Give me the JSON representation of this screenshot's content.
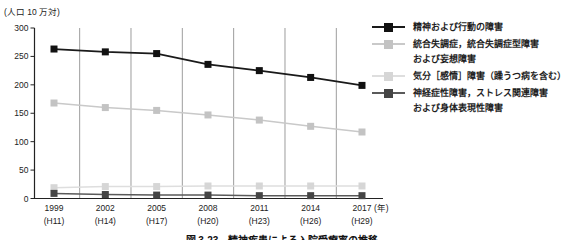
{
  "caption": "図 3-23　精神疾患による入院受療率の推移",
  "chart_data": {
    "type": "line",
    "unit_label": "(人口 10 万対)",
    "x_suffix": "(年)",
    "ylim": [
      0,
      300
    ],
    "yticks": [
      0,
      50,
      100,
      150,
      200,
      250,
      300
    ],
    "grid": "vertical-between-categories",
    "legend_position": "right",
    "categories": [
      {
        "year": "1999",
        "era": "(H11)"
      },
      {
        "year": "2002",
        "era": "(H14)"
      },
      {
        "year": "2005",
        "era": "(H17)"
      },
      {
        "year": "2008",
        "era": "(H20)"
      },
      {
        "year": "2011",
        "era": "(H23)"
      },
      {
        "year": "2014",
        "era": "(H26)"
      },
      {
        "year": "2017",
        "era": "(H29)"
      }
    ],
    "series": [
      {
        "name": "精神および行動の障害",
        "legend_lines": [
          "精神および行動の障害"
        ],
        "line_color": "#1a1a1a",
        "marker_color": "#111111",
        "values": [
          263,
          258,
          255,
          236,
          225,
          213,
          199
        ]
      },
      {
        "name": "統合失調症，統合失調症型障害および妄想障害",
        "legend_lines": [
          "統合失調症，統合失調症型障害",
          "および妄想障害"
        ],
        "line_color": "#c9c9c9",
        "marker_color": "#c3c3c3",
        "values": [
          168,
          160,
          155,
          147,
          138,
          127,
          117
        ]
      },
      {
        "name": "気分［感情］障害（躁うつ病を含む）",
        "legend_lines": [
          "気分［感情］障害（躁うつ病を含む）"
        ],
        "line_color": "#dedede",
        "marker_color": "#d6d6d6",
        "values": [
          19,
          21,
          21,
          22,
          22,
          22,
          22
        ]
      },
      {
        "name": "神経症性障害，ストレス関連障害および身体表現性障害",
        "legend_lines": [
          "神経症性障害，ストレス関連障害",
          "および身体表現性障害"
        ],
        "line_color": "#5a5a5a",
        "marker_color": "#454545",
        "values": [
          9,
          7,
          6,
          6,
          5,
          5,
          5
        ]
      }
    ],
    "style": {
      "axis_color": "#222222",
      "grid_color": "#9d9d9d",
      "text_color": "#222222"
    }
  }
}
